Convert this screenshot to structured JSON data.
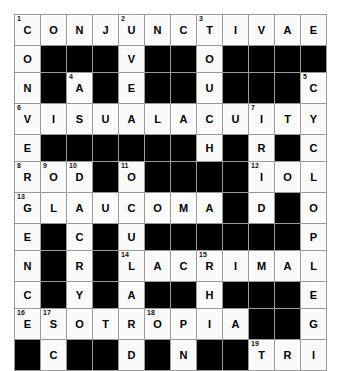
{
  "puzzle": {
    "title": "Ophthalmology Crossword",
    "rows": 12,
    "cols": 12,
    "colors": {
      "page_background": "#ffffff",
      "open_cell": "#fafafa",
      "block_cell": "#000000",
      "grid_line": "#9a9a9a",
      "letter_color": "#000000",
      "number_color": "#111111"
    },
    "grid": [
      [
        {
          "type": "open",
          "num": "1",
          "letter": "C"
        },
        {
          "type": "open",
          "num": "",
          "letter": "O"
        },
        {
          "type": "open",
          "num": "",
          "letter": "N"
        },
        {
          "type": "open",
          "num": "",
          "letter": "J"
        },
        {
          "type": "open",
          "num": "2",
          "letter": "U"
        },
        {
          "type": "open",
          "num": "",
          "letter": "N"
        },
        {
          "type": "open",
          "num": "",
          "letter": "C"
        },
        {
          "type": "open",
          "num": "3",
          "letter": "T"
        },
        {
          "type": "open",
          "num": "",
          "letter": "I"
        },
        {
          "type": "open",
          "num": "",
          "letter": "V"
        },
        {
          "type": "open",
          "num": "",
          "letter": "A"
        },
        {
          "type": "open",
          "num": "",
          "letter": "E"
        }
      ],
      [
        {
          "type": "open",
          "num": "",
          "letter": "O"
        },
        {
          "type": "block",
          "num": "",
          "letter": ""
        },
        {
          "type": "block",
          "num": "",
          "letter": ""
        },
        {
          "type": "block",
          "num": "",
          "letter": ""
        },
        {
          "type": "open",
          "num": "",
          "letter": "V"
        },
        {
          "type": "block",
          "num": "",
          "letter": ""
        },
        {
          "type": "block",
          "num": "",
          "letter": ""
        },
        {
          "type": "open",
          "num": "",
          "letter": "O"
        },
        {
          "type": "block",
          "num": "",
          "letter": ""
        },
        {
          "type": "block",
          "num": "",
          "letter": ""
        },
        {
          "type": "block",
          "num": "",
          "letter": ""
        },
        {
          "type": "block",
          "num": "",
          "letter": ""
        }
      ],
      [
        {
          "type": "open",
          "num": "",
          "letter": "N"
        },
        {
          "type": "block",
          "num": "",
          "letter": ""
        },
        {
          "type": "open",
          "num": "4",
          "letter": "A"
        },
        {
          "type": "block",
          "num": "",
          "letter": ""
        },
        {
          "type": "open",
          "num": "",
          "letter": "E"
        },
        {
          "type": "block",
          "num": "",
          "letter": ""
        },
        {
          "type": "block",
          "num": "",
          "letter": ""
        },
        {
          "type": "open",
          "num": "",
          "letter": "U"
        },
        {
          "type": "block",
          "num": "",
          "letter": ""
        },
        {
          "type": "block",
          "num": "",
          "letter": ""
        },
        {
          "type": "block",
          "num": "",
          "letter": ""
        },
        {
          "type": "open",
          "num": "5",
          "letter": "C"
        }
      ],
      [
        {
          "type": "open",
          "num": "6",
          "letter": "V"
        },
        {
          "type": "open",
          "num": "",
          "letter": "I"
        },
        {
          "type": "open",
          "num": "",
          "letter": "S"
        },
        {
          "type": "open",
          "num": "",
          "letter": "U"
        },
        {
          "type": "open",
          "num": "",
          "letter": "A"
        },
        {
          "type": "open",
          "num": "",
          "letter": "L"
        },
        {
          "type": "open",
          "num": "",
          "letter": "A"
        },
        {
          "type": "open",
          "num": "",
          "letter": "C"
        },
        {
          "type": "open",
          "num": "",
          "letter": "U"
        },
        {
          "type": "open",
          "num": "7",
          "letter": "I"
        },
        {
          "type": "open",
          "num": "",
          "letter": "T"
        },
        {
          "type": "open",
          "num": "",
          "letter": "Y"
        }
      ],
      [
        {
          "type": "open",
          "num": "",
          "letter": "E"
        },
        {
          "type": "block",
          "num": "",
          "letter": ""
        },
        {
          "type": "block",
          "num": "",
          "letter": ""
        },
        {
          "type": "block",
          "num": "",
          "letter": ""
        },
        {
          "type": "block",
          "num": "",
          "letter": ""
        },
        {
          "type": "block",
          "num": "",
          "letter": ""
        },
        {
          "type": "block",
          "num": "",
          "letter": ""
        },
        {
          "type": "open",
          "num": "",
          "letter": "H"
        },
        {
          "type": "block",
          "num": "",
          "letter": ""
        },
        {
          "type": "open",
          "num": "",
          "letter": "R"
        },
        {
          "type": "block",
          "num": "",
          "letter": ""
        },
        {
          "type": "open",
          "num": "",
          "letter": "C"
        }
      ],
      [
        {
          "type": "open",
          "num": "8",
          "letter": "R"
        },
        {
          "type": "open",
          "num": "9",
          "letter": "O"
        },
        {
          "type": "open",
          "num": "10",
          "letter": "D"
        },
        {
          "type": "block",
          "num": "",
          "letter": ""
        },
        {
          "type": "open",
          "num": "11",
          "letter": "O"
        },
        {
          "type": "block",
          "num": "",
          "letter": ""
        },
        {
          "type": "block",
          "num": "",
          "letter": ""
        },
        {
          "type": "block",
          "num": "",
          "letter": ""
        },
        {
          "type": "block",
          "num": "",
          "letter": ""
        },
        {
          "type": "open",
          "num": "12",
          "letter": "I"
        },
        {
          "type": "open",
          "num": "",
          "letter": "O"
        },
        {
          "type": "open",
          "num": "",
          "letter": "L"
        }
      ],
      [
        {
          "type": "open",
          "num": "13",
          "letter": "G"
        },
        {
          "type": "open",
          "num": "",
          "letter": "L"
        },
        {
          "type": "open",
          "num": "",
          "letter": "A"
        },
        {
          "type": "open",
          "num": "",
          "letter": "U"
        },
        {
          "type": "open",
          "num": "",
          "letter": "C"
        },
        {
          "type": "open",
          "num": "",
          "letter": "O"
        },
        {
          "type": "open",
          "num": "",
          "letter": "M"
        },
        {
          "type": "open",
          "num": "",
          "letter": "A"
        },
        {
          "type": "block",
          "num": "",
          "letter": ""
        },
        {
          "type": "open",
          "num": "",
          "letter": "D"
        },
        {
          "type": "block",
          "num": "",
          "letter": ""
        },
        {
          "type": "open",
          "num": "",
          "letter": "O"
        }
      ],
      [
        {
          "type": "open",
          "num": "",
          "letter": "E"
        },
        {
          "type": "block",
          "num": "",
          "letter": ""
        },
        {
          "type": "open",
          "num": "",
          "letter": "C"
        },
        {
          "type": "block",
          "num": "",
          "letter": ""
        },
        {
          "type": "open",
          "num": "",
          "letter": "U"
        },
        {
          "type": "block",
          "num": "",
          "letter": ""
        },
        {
          "type": "block",
          "num": "",
          "letter": ""
        },
        {
          "type": "block",
          "num": "",
          "letter": ""
        },
        {
          "type": "block",
          "num": "",
          "letter": ""
        },
        {
          "type": "block",
          "num": "",
          "letter": ""
        },
        {
          "type": "block",
          "num": "",
          "letter": ""
        },
        {
          "type": "open",
          "num": "",
          "letter": "P"
        }
      ],
      [
        {
          "type": "open",
          "num": "",
          "letter": "N"
        },
        {
          "type": "block",
          "num": "",
          "letter": ""
        },
        {
          "type": "open",
          "num": "",
          "letter": "R"
        },
        {
          "type": "block",
          "num": "",
          "letter": ""
        },
        {
          "type": "open",
          "num": "14",
          "letter": "L"
        },
        {
          "type": "open",
          "num": "",
          "letter": "A"
        },
        {
          "type": "open",
          "num": "",
          "letter": "C"
        },
        {
          "type": "open",
          "num": "15",
          "letter": "R"
        },
        {
          "type": "open",
          "num": "",
          "letter": "I"
        },
        {
          "type": "open",
          "num": "",
          "letter": "M"
        },
        {
          "type": "open",
          "num": "",
          "letter": "A"
        },
        {
          "type": "open",
          "num": "",
          "letter": "L"
        }
      ],
      [
        {
          "type": "open",
          "num": "",
          "letter": "C"
        },
        {
          "type": "block",
          "num": "",
          "letter": ""
        },
        {
          "type": "open",
          "num": "",
          "letter": "Y"
        },
        {
          "type": "block",
          "num": "",
          "letter": ""
        },
        {
          "type": "open",
          "num": "",
          "letter": "A"
        },
        {
          "type": "block",
          "num": "",
          "letter": ""
        },
        {
          "type": "block",
          "num": "",
          "letter": ""
        },
        {
          "type": "open",
          "num": "",
          "letter": "H"
        },
        {
          "type": "block",
          "num": "",
          "letter": ""
        },
        {
          "type": "block",
          "num": "",
          "letter": ""
        },
        {
          "type": "block",
          "num": "",
          "letter": ""
        },
        {
          "type": "open",
          "num": "",
          "letter": "E"
        }
      ],
      [
        {
          "type": "open",
          "num": "16",
          "letter": "E"
        },
        {
          "type": "open",
          "num": "17",
          "letter": "S"
        },
        {
          "type": "open",
          "num": "",
          "letter": "O"
        },
        {
          "type": "open",
          "num": "",
          "letter": "T"
        },
        {
          "type": "open",
          "num": "",
          "letter": "R"
        },
        {
          "type": "open",
          "num": "18",
          "letter": "O"
        },
        {
          "type": "open",
          "num": "",
          "letter": "P"
        },
        {
          "type": "open",
          "num": "",
          "letter": "I"
        },
        {
          "type": "open",
          "num": "",
          "letter": "A"
        },
        {
          "type": "block",
          "num": "",
          "letter": ""
        },
        {
          "type": "block",
          "num": "",
          "letter": ""
        },
        {
          "type": "open",
          "num": "",
          "letter": "G"
        }
      ],
      [
        {
          "type": "block",
          "num": "",
          "letter": ""
        },
        {
          "type": "open",
          "num": "",
          "letter": "C"
        },
        {
          "type": "block",
          "num": "",
          "letter": ""
        },
        {
          "type": "block",
          "num": "",
          "letter": ""
        },
        {
          "type": "open",
          "num": "",
          "letter": "D"
        },
        {
          "type": "block",
          "num": "",
          "letter": ""
        },
        {
          "type": "open",
          "num": "",
          "letter": "N"
        },
        {
          "type": "block",
          "num": "",
          "letter": ""
        },
        {
          "type": "block",
          "num": "",
          "letter": ""
        },
        {
          "type": "open",
          "num": "19",
          "letter": "T"
        },
        {
          "type": "open",
          "num": "",
          "letter": "R"
        },
        {
          "type": "open",
          "num": "",
          "letter": "I"
        }
      ]
    ]
  }
}
